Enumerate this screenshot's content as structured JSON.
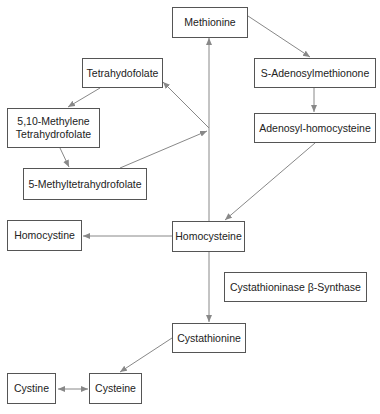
{
  "diagram": {
    "nodes": {
      "methionine": "Methionine",
      "tetrahydofolate": "Tetrahydofolate",
      "methylene_thf_1": "5,10-Methylene",
      "methylene_thf_2": "Tetrahydrofolate",
      "methyl_thf": "5-Methyltetrahydrofolate",
      "sam": "S-Adenosylmethionone",
      "sah": "Adenosyl-homocysteine",
      "homocystine": "Homocystine",
      "homocysteine": "Homocysteine",
      "enzyme": "Cystathioninase β-Synthase",
      "cystathionine": "Cystathionine",
      "cystine": "Cystine",
      "cysteine": "Cysteine"
    },
    "edges": [
      {
        "from": "Methionine",
        "to": "S-Adenosylmethionone"
      },
      {
        "from": "S-Adenosylmethionone",
        "to": "Adenosyl-homocysteine"
      },
      {
        "from": "Adenosyl-homocysteine",
        "to": "Homocysteine"
      },
      {
        "from": "Homocysteine",
        "to": "Methionine"
      },
      {
        "from": "5-Methyltetrahydrofolate",
        "to": "junction"
      },
      {
        "from": "junction",
        "to": "Tetrahydofolate"
      },
      {
        "from": "Tetrahydofolate",
        "to": "5,10-Methylene Tetrahydrofolate"
      },
      {
        "from": "5,10-Methylene Tetrahydrofolate",
        "to": "5-Methyltetrahydrofolate"
      },
      {
        "from": "Homocysteine",
        "to": "Homocystine"
      },
      {
        "from": "Homocysteine",
        "to": "Cystathionine"
      },
      {
        "from": "Cystathionine",
        "to": "Cysteine"
      },
      {
        "from": "Cystine",
        "to": "Cysteine",
        "bidirectional": true
      }
    ],
    "colors": {
      "line": "#888888",
      "border": "#555555",
      "text": "#222222"
    }
  }
}
